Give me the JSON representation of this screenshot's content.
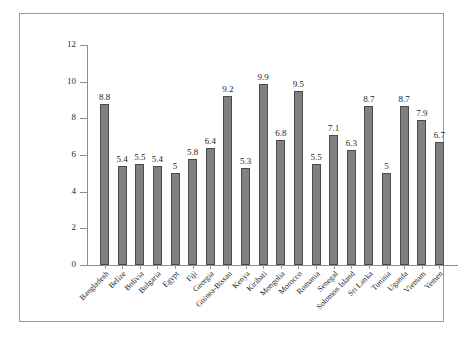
{
  "chart_data": {
    "type": "bar",
    "title": "",
    "subtitle": "",
    "xlabel": "",
    "ylabel": "",
    "ylim": [
      0,
      12
    ],
    "yticks": [
      0,
      2,
      4,
      6,
      8,
      10,
      12
    ],
    "grid": false,
    "legend": false,
    "data_labels": true,
    "bar_color": "#808080",
    "bar_outline_color": "#4a4a4a",
    "axis_color": "#8d8d8d",
    "frame_color": "#9a9a9a",
    "background_color": "#ffffff",
    "categories": [
      "Bangladesh",
      "Belize",
      "Bolivia",
      "Bulgaria",
      "Egypt",
      "Fiji",
      "Georgia",
      "Guinea-Bissau",
      "Kenya",
      "Kiribati",
      "Mongolia",
      "Morocco",
      "Romania",
      "Senegal",
      "Solomon Island",
      "Sri Lanka",
      "Tunisia",
      "Uganda",
      "Vietnam",
      "Yemen"
    ],
    "values": [
      8.8,
      5.4,
      5.5,
      5.4,
      5,
      5.8,
      6.4,
      9.2,
      5.3,
      9.9,
      6.8,
      9.5,
      5.5,
      7.1,
      6.3,
      8.7,
      5,
      8.7,
      7.9,
      6.7
    ],
    "value_labels": [
      "8.8",
      "5.4",
      "5.5",
      "5.4",
      "5",
      "5.8",
      "6.4",
      "9.2",
      "5.3",
      "9.9",
      "6.8",
      "9.5",
      "5.5",
      "7.1",
      "6.3",
      "8.7",
      "5",
      "8.7",
      "7.9",
      "6.7"
    ],
    "ytick_labels": [
      "0",
      "2",
      "4",
      "6",
      "8",
      "10",
      "12"
    ]
  }
}
